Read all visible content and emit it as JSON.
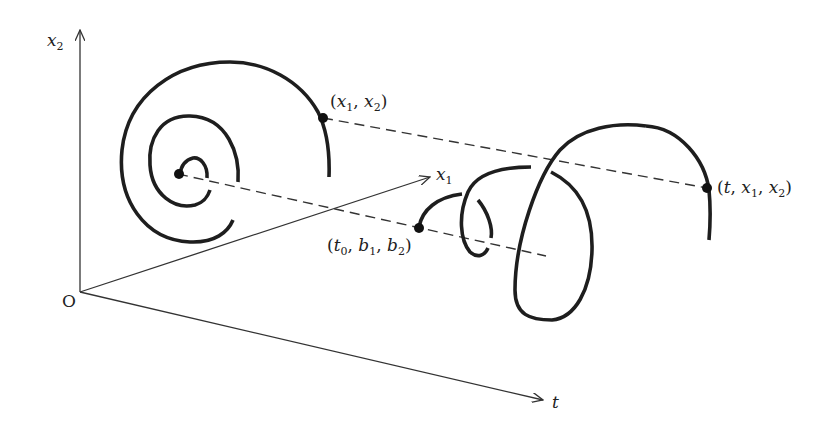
{
  "diagram": {
    "axes": {
      "origin_label": "O",
      "x2_label": "x",
      "x2_sub": "2",
      "x1_label": "x",
      "x1_sub": "1",
      "t_label": "t"
    },
    "points": {
      "phase_point": {
        "open": "(",
        "a": "x",
        "a_sub": "1",
        "sep": ", ",
        "b": "x",
        "b_sub": "2",
        "close": ")"
      },
      "initial_point": {
        "open": "(",
        "a": "t",
        "a_sub": "0",
        "sep1": ", ",
        "b": "b",
        "b_sub": "1",
        "sep2": ", ",
        "c": "b",
        "c_sub": "2",
        "close": ")"
      },
      "trajectory_point": {
        "open": "(",
        "a": "t",
        "sep1": ", ",
        "b": "x",
        "b_sub": "1",
        "sep2": ", ",
        "c": "x",
        "c_sub": "2",
        "close": ")"
      }
    },
    "colors": {
      "curve": "#1e1e1e",
      "axis": "#333333",
      "background": "#ffffff"
    }
  }
}
